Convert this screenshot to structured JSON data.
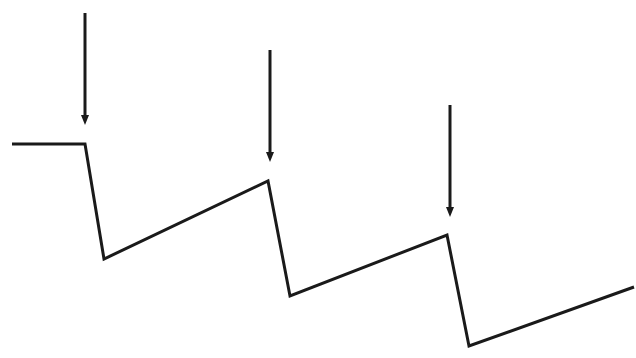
{
  "diagram": {
    "type": "sawtooth-line-diagram",
    "stroke_color": "#1a1a1a",
    "background": "#ffffff",
    "polyline_points": [
      [
        12,
        144
      ],
      [
        85,
        144
      ],
      [
        104,
        259
      ],
      [
        268,
        181
      ],
      [
        290,
        296
      ],
      [
        447,
        235
      ],
      [
        469,
        346
      ],
      [
        634,
        287
      ]
    ],
    "arrows": [
      {
        "x": 85,
        "y_start": 13,
        "y_end": 125
      },
      {
        "x": 270,
        "y_start": 50,
        "y_end": 162
      },
      {
        "x": 450,
        "y_start": 105,
        "y_end": 217
      }
    ]
  },
  "caption": {
    "text": "",
    "note": "cut off at bottom edge"
  }
}
